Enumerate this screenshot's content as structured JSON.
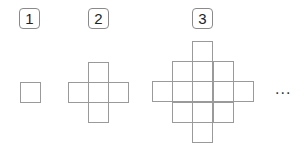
{
  "figure": {
    "patterns": [
      {
        "label": "1",
        "cells": [
          [
            0,
            0
          ]
        ]
      },
      {
        "label": "2",
        "cells": [
          [
            1,
            0
          ],
          [
            0,
            1
          ],
          [
            1,
            1
          ],
          [
            2,
            1
          ],
          [
            1,
            2
          ]
        ]
      },
      {
        "label": "3",
        "cells": [
          [
            2,
            0
          ],
          [
            1,
            1
          ],
          [
            2,
            1
          ],
          [
            3,
            1
          ],
          [
            0,
            2
          ],
          [
            1,
            2
          ],
          [
            2,
            2
          ],
          [
            3,
            2
          ],
          [
            4,
            2
          ],
          [
            1,
            3
          ],
          [
            2,
            3
          ],
          [
            3,
            3
          ],
          [
            2,
            4
          ]
        ]
      }
    ],
    "continuation": "..."
  }
}
